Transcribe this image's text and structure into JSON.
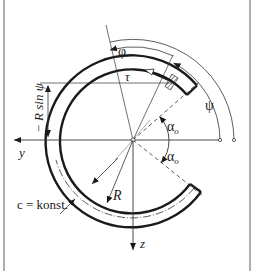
{
  "figure": {
    "labels": {
      "phi": "φ",
      "tau": "τ",
      "psi": "ψ",
      "alpha_upper": "α",
      "alpha_upper_sub": "o",
      "alpha_lower": "α",
      "alpha_lower_sub": "o",
      "y_axis": "y",
      "z_axis": "z",
      "radius": "R",
      "wall_note": "c = konst.",
      "dimension": "− R sin ψ"
    },
    "colors": {
      "line": "#1a1a1a",
      "thin_line": "#333333",
      "background": "#ffffff",
      "border": "#777777"
    }
  }
}
